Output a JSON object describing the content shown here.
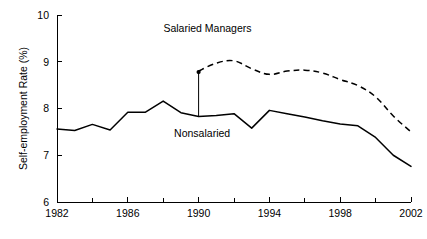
{
  "chart_data": {
    "type": "line",
    "title": "",
    "xlabel": "",
    "ylabel": "Self-employment Rate (%)",
    "xlim": [
      1982,
      2002
    ],
    "ylim": [
      6,
      10
    ],
    "grid": false,
    "legend_position": "inline-annotation",
    "y_ticks": [
      "6",
      "7",
      "8",
      "9",
      "10"
    ],
    "y_tick_values": [
      6,
      7,
      8,
      9,
      10
    ],
    "x_ticks": [
      "1982",
      "1986",
      "1990",
      "1994",
      "1998",
      "2002"
    ],
    "x_tick_values": [
      1982,
      1986,
      1990,
      1994,
      1998,
      2002
    ],
    "x_minor_tick_values": [
      1984,
      1988,
      1992,
      1996,
      2000
    ],
    "x": [
      1982,
      1983,
      1984,
      1985,
      1986,
      1987,
      1988,
      1989,
      1990,
      1991,
      1992,
      1993,
      1994,
      1995,
      1996,
      1997,
      1998,
      1999,
      2000,
      2001,
      2002
    ],
    "series": [
      {
        "name": "Nonsalaried",
        "style": "solid",
        "color": "#000000",
        "x": [
          1982,
          1983,
          1984,
          1985,
          1986,
          1987,
          1988,
          1989,
          1990,
          1991,
          1992,
          1993,
          1994,
          1995,
          1996,
          1997,
          1998,
          1999,
          2000,
          2001,
          2002
        ],
        "values": [
          7.56,
          7.53,
          7.66,
          7.54,
          7.92,
          7.92,
          8.16,
          7.91,
          7.83,
          7.85,
          7.89,
          7.58,
          7.96,
          7.89,
          7.82,
          7.74,
          7.67,
          7.63,
          7.38,
          7.0,
          6.76
        ]
      },
      {
        "name": "Salaried Managers",
        "style": "dashed",
        "color": "#000000",
        "x": [
          1990,
          1991,
          1992,
          1993,
          1994,
          1995,
          1996,
          1997,
          1998,
          1999,
          2000,
          2001,
          2002
        ],
        "values": [
          8.8,
          8.97,
          9.02,
          8.85,
          8.73,
          8.8,
          8.82,
          8.76,
          8.62,
          8.49,
          8.25,
          7.84,
          7.5
        ]
      }
    ],
    "annotations": [
      {
        "name": "salaried-managers-label",
        "text": "Salaried Managers",
        "x": 1990.5,
        "y": 9.63
      },
      {
        "name": "nonsalaried-label",
        "text": "Nonsalaried",
        "x": 1990.2,
        "y": 7.4
      },
      {
        "name": "pointer-arrow",
        "text": "",
        "from_x": 1990,
        "from_y": 7.82,
        "to_x": 1990,
        "to_y": 8.78
      }
    ]
  },
  "axes": {
    "y_axis_title": "Self-employment Rate (%)"
  }
}
